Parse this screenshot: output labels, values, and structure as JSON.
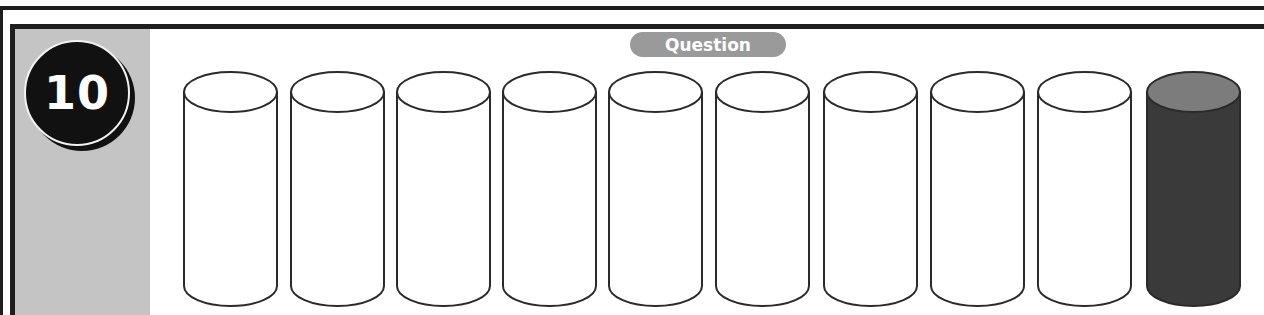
{
  "question": {
    "number": "10",
    "label": "Question"
  },
  "cylinders": {
    "count": 10,
    "shaded_count": 1,
    "items": [
      {
        "index": 1,
        "shaded": false
      },
      {
        "index": 2,
        "shaded": false
      },
      {
        "index": 3,
        "shaded": false
      },
      {
        "index": 4,
        "shaded": false
      },
      {
        "index": 5,
        "shaded": false
      },
      {
        "index": 6,
        "shaded": false
      },
      {
        "index": 7,
        "shaded": false
      },
      {
        "index": 8,
        "shaded": false
      },
      {
        "index": 9,
        "shaded": false
      },
      {
        "index": 10,
        "shaded": true
      }
    ]
  },
  "colors": {
    "frame": "#1e1e1e",
    "panel": "#c4c4c4",
    "badge": "#111111",
    "pill": "#9a9a9a",
    "shaded_body": "#3a3a3a",
    "shaded_top": "#7c7c7c",
    "outline": "#2a2a2a"
  }
}
